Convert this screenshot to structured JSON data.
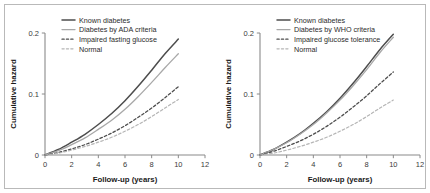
{
  "figure": {
    "background_color": "#ffffff",
    "frame_color": "#b9b9b9"
  },
  "chart_data": [
    {
      "type": "line",
      "panel": "left",
      "title": "",
      "xlabel": "Follow-up (years)",
      "ylabel": "Cumulative hazard",
      "xlim": [
        0,
        12
      ],
      "ylim": [
        0,
        0.2
      ],
      "xticks": [
        0,
        2,
        4,
        6,
        8,
        10,
        12
      ],
      "xtick_labels": [
        "0",
        "2",
        "4",
        "6",
        "8",
        "10",
        "12"
      ],
      "yticks": [
        0,
        0.1,
        0.2
      ],
      "ytick_labels": [
        "0",
        "0.1",
        "0.2"
      ],
      "grid": false,
      "legend_position": "top-center",
      "x": [
        0,
        1,
        2,
        3,
        4,
        5,
        6,
        7,
        8,
        9,
        10
      ],
      "series": [
        {
          "name": "Known diabetes",
          "color": "#4d4d4d",
          "style": "solid",
          "width": 1.5,
          "values": [
            0,
            0.009,
            0.021,
            0.034,
            0.05,
            0.068,
            0.089,
            0.113,
            0.139,
            0.166,
            0.19
          ]
        },
        {
          "name": "Diabetes by ADA criteria",
          "color": "#a8a8a8",
          "style": "solid",
          "width": 1.3,
          "values": [
            0,
            0.007,
            0.017,
            0.028,
            0.042,
            0.057,
            0.075,
            0.096,
            0.119,
            0.143,
            0.166
          ]
        },
        {
          "name": "Impaired fasting glucose",
          "color": "#4d4d4d",
          "style": "dashed",
          "width": 1.3,
          "values": [
            0,
            0.004,
            0.01,
            0.017,
            0.026,
            0.036,
            0.048,
            0.062,
            0.077,
            0.094,
            0.112
          ]
        },
        {
          "name": "Normal",
          "color": "#b5b5b5",
          "style": "dashed",
          "width": 1.2,
          "values": [
            0,
            0.003,
            0.008,
            0.014,
            0.021,
            0.029,
            0.039,
            0.05,
            0.063,
            0.077,
            0.091
          ]
        }
      ]
    },
    {
      "type": "line",
      "panel": "right",
      "title": "",
      "xlabel": "Follow-up (years)",
      "ylabel": "Cumulative hazard",
      "xlim": [
        0,
        12
      ],
      "ylim": [
        0,
        0.2
      ],
      "xticks": [
        0,
        2,
        4,
        6,
        8,
        10,
        12
      ],
      "xtick_labels": [
        "0",
        "2",
        "4",
        "6",
        "8",
        "10",
        "12"
      ],
      "yticks": [
        0,
        0.1,
        0.2
      ],
      "ytick_labels": [
        "0",
        "0.1",
        "0.2"
      ],
      "grid": false,
      "legend_position": "top-center",
      "x": [
        0,
        1,
        2,
        3,
        4,
        5,
        6,
        7,
        8,
        9,
        10
      ],
      "series": [
        {
          "name": "Known diabetes",
          "color": "#4d4d4d",
          "style": "solid",
          "width": 1.5,
          "values": [
            0,
            0.009,
            0.021,
            0.035,
            0.052,
            0.071,
            0.093,
            0.118,
            0.145,
            0.173,
            0.198
          ]
        },
        {
          "name": "Diabetes by WHO criteria",
          "color": "#a8a8a8",
          "style": "solid",
          "width": 1.3,
          "values": [
            0,
            0.009,
            0.02,
            0.034,
            0.05,
            0.069,
            0.09,
            0.114,
            0.14,
            0.168,
            0.193
          ]
        },
        {
          "name": "Impaired glucose tolerance",
          "color": "#4d4d4d",
          "style": "dashed",
          "width": 1.3,
          "values": [
            0,
            0.006,
            0.014,
            0.023,
            0.034,
            0.047,
            0.062,
            0.079,
            0.097,
            0.117,
            0.136
          ]
        },
        {
          "name": "Normal",
          "color": "#b5b5b5",
          "style": "dashed",
          "width": 1.2,
          "values": [
            0,
            0.003,
            0.008,
            0.014,
            0.021,
            0.029,
            0.039,
            0.05,
            0.063,
            0.077,
            0.09
          ]
        }
      ]
    }
  ]
}
